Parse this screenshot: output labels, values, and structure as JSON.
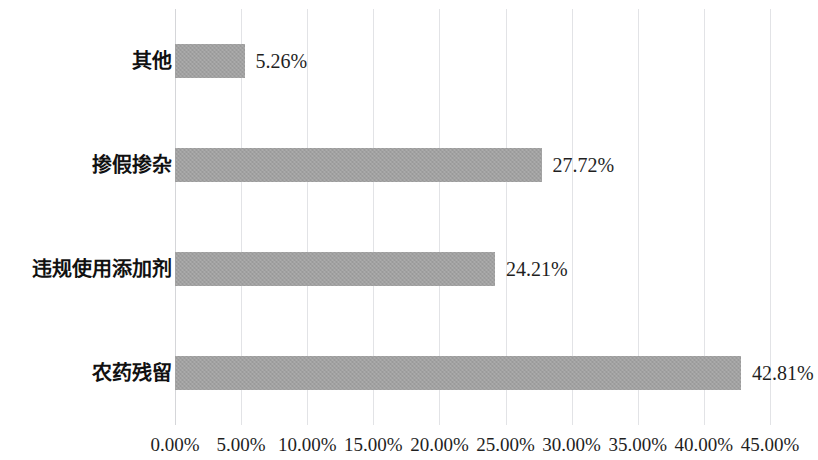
{
  "chart_data": {
    "type": "bar",
    "orientation": "horizontal",
    "title": "",
    "subtitle": "",
    "xlabel": "",
    "ylabel": "",
    "categories": [
      "其他",
      "掺假掺杂",
      "违规使用添加剂",
      "农药残留"
    ],
    "values": [
      5.26,
      27.72,
      24.21,
      42.81
    ],
    "value_labels": [
      "5.26%",
      "27.72%",
      "24.21%",
      "42.81%"
    ],
    "xlim": [
      0,
      45
    ],
    "xticks": [
      0,
      5,
      10,
      15,
      20,
      25,
      30,
      35,
      40,
      45
    ],
    "xtick_labels": [
      "0.00%",
      "5.00%",
      "10.00%",
      "15.00%",
      "20.00%",
      "25.00%",
      "30.00%",
      "35.00%",
      "40.00%",
      "45.00%"
    ],
    "grid": true,
    "grid_axis": "x",
    "legend": false,
    "legend_position": "none",
    "series": [
      {
        "name": "",
        "values": [
          5.26,
          27.72,
          24.21,
          42.81
        ]
      }
    ],
    "colors": {
      "bar_fill": "#a1a1a1",
      "gridline": "#e2e3e6",
      "text": "#1f1f1f",
      "background": "#ffffff"
    }
  }
}
